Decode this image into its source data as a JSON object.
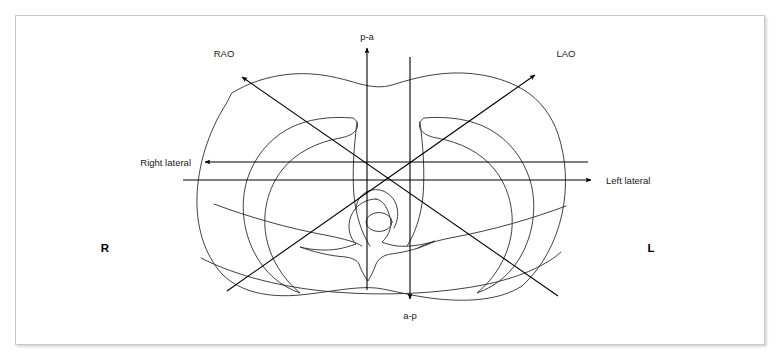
{
  "figure": {
    "frame_color": "#c9c9c9",
    "line_color": "#000000",
    "anatomy_color": "#2b2b2b"
  },
  "labels": {
    "pa": "p-a",
    "ap": "a-p",
    "rao": "RAO",
    "lao": "LAO",
    "right_lateral": "Right lateral",
    "left_lateral": "Left lateral",
    "right_marker": "R",
    "left_marker": "L"
  },
  "projections": [
    {
      "id": "pa",
      "label": "p-a",
      "direction": "up",
      "arrow_tip": [
        367,
        45
      ],
      "origin": [
        367,
        290
      ]
    },
    {
      "id": "ap",
      "label": "a-p",
      "direction": "down",
      "arrow_tip": [
        410,
        302
      ],
      "origin": [
        410,
        57
      ]
    },
    {
      "id": "rao",
      "label": "RAO",
      "direction": "up-left",
      "arrow_tip": [
        237,
        72
      ],
      "origin": [
        558,
        296
      ]
    },
    {
      "id": "lao",
      "label": "LAO",
      "direction": "up-right",
      "arrow_tip": [
        540,
        70
      ],
      "origin": [
        227,
        291
      ]
    },
    {
      "id": "right-lateral",
      "label": "Right lateral",
      "direction": "left",
      "arrow_tip": [
        200,
        162
      ],
      "origin": [
        588,
        162
      ]
    },
    {
      "id": "left-lateral",
      "label": "Left lateral",
      "direction": "right",
      "arrow_tip": [
        596,
        180
      ],
      "origin": [
        183,
        180
      ]
    }
  ],
  "side_markers": [
    {
      "id": "right",
      "label": "R",
      "position": [
        105,
        248
      ]
    },
    {
      "id": "left",
      "label": "L",
      "position": [
        651,
        248
      ]
    }
  ],
  "anatomy": {
    "parts": [
      "thoracic-outline",
      "left-lung-field",
      "right-lung-field",
      "vertebra",
      "spinal-canal"
    ]
  }
}
